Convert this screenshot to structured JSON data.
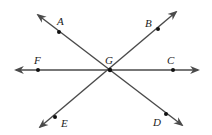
{
  "diagram": {
    "type": "intersecting-lines",
    "center": {
      "label": "G",
      "x": 110,
      "y": 70
    },
    "points": [
      {
        "label": "A",
        "x": 59,
        "y": 32,
        "lx": 57,
        "ly": 25
      },
      {
        "label": "B",
        "x": 158,
        "y": 29,
        "lx": 145,
        "ly": 27
      },
      {
        "label": "C",
        "x": 173,
        "y": 70,
        "lx": 167,
        "ly": 64
      },
      {
        "label": "D",
        "x": 166,
        "y": 114,
        "lx": 153,
        "ly": 126
      },
      {
        "label": "E",
        "x": 55,
        "y": 117,
        "lx": 61,
        "ly": 127
      },
      {
        "label": "F",
        "x": 38,
        "y": 70,
        "lx": 34,
        "ly": 64
      }
    ],
    "lines": [
      {
        "name": "line-FC",
        "x1": 16,
        "y1": 70,
        "x2": 198,
        "y2": 70
      },
      {
        "name": "line-AD",
        "x1": 38,
        "y1": 15,
        "x2": 182,
        "y2": 125
      },
      {
        "name": "line-EB",
        "x1": 40,
        "y1": 127,
        "x2": 176,
        "y2": 12
      }
    ],
    "stroke_color": "#4a4a4a",
    "point_color": "#111111"
  }
}
